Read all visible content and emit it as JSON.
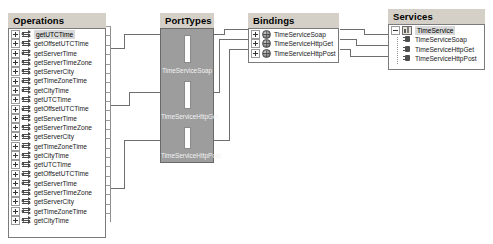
{
  "diagram": {
    "colors": {
      "panel_header_bg": "#d4d0c8",
      "panel_border": "#7b7b7b",
      "porttype_fill": "#9d9d9d",
      "wire": "#6e6e6e",
      "selection": "#d8d8d8"
    }
  },
  "operations": {
    "header": "Operations",
    "items": [
      {
        "label": "getUTCTime",
        "expander": "plus",
        "selected": true
      },
      {
        "label": "getOffsetUTCTime",
        "expander": "plus",
        "selected": false
      },
      {
        "label": "getServerTime",
        "expander": "plus",
        "selected": false
      },
      {
        "label": "getServerTimeZone",
        "expander": "plus",
        "selected": false
      },
      {
        "label": "getServerCity",
        "expander": "plus",
        "selected": false
      },
      {
        "label": "getTimeZoneTime",
        "expander": "plus",
        "selected": false
      },
      {
        "label": "getCityTime",
        "expander": "plus",
        "selected": false
      },
      {
        "label": "getUTCTime",
        "expander": "plus",
        "selected": false
      },
      {
        "label": "getOffsetUTCTime",
        "expander": "plus",
        "selected": false
      },
      {
        "label": "getServerTime",
        "expander": "plus",
        "selected": false
      },
      {
        "label": "getServerTimeZone",
        "expander": "plus",
        "selected": false
      },
      {
        "label": "getServerCity",
        "expander": "plus",
        "selected": false
      },
      {
        "label": "getTimeZoneTime",
        "expander": "plus",
        "selected": false
      },
      {
        "label": "getCityTime",
        "expander": "plus",
        "selected": false
      },
      {
        "label": "getUTCTime",
        "expander": "plus",
        "selected": false
      },
      {
        "label": "getOffsetUTCTime",
        "expander": "plus",
        "selected": false
      },
      {
        "label": "getServerTime",
        "expander": "plus",
        "selected": false
      },
      {
        "label": "getServerTimeZone",
        "expander": "plus",
        "selected": false
      },
      {
        "label": "getServerCity",
        "expander": "plus",
        "selected": false
      },
      {
        "label": "getTimeZoneTime",
        "expander": "plus",
        "selected": false
      },
      {
        "label": "getCityTime",
        "expander": "plus",
        "selected": false
      }
    ]
  },
  "porttypes": {
    "header": "PortTypes",
    "items": [
      {
        "label": "TimeServiceSoap"
      },
      {
        "label": "TimeServiceHttpGet"
      },
      {
        "label": "TimeServiceHttpPost"
      }
    ]
  },
  "bindings": {
    "header": "Bindings",
    "items": [
      {
        "label": "TimeServiceSoap",
        "expander": "plus"
      },
      {
        "label": "TimeServiceHttpGet",
        "expander": "plus"
      },
      {
        "label": "TimeServiceHttpPost",
        "expander": "plus"
      }
    ]
  },
  "services": {
    "header": "Services",
    "root": {
      "label": "TimeService",
      "expander": "minus",
      "selected": true
    },
    "ports": [
      {
        "label": "TimeServiceSoap"
      },
      {
        "label": "TimeServiceHttpGet"
      },
      {
        "label": "TimeServiceHttpPost"
      }
    ]
  }
}
